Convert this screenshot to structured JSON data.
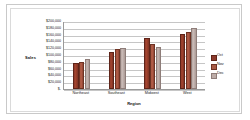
{
  "chart_data": {
    "type": "bar",
    "title": "",
    "xlabel": "Region",
    "ylabel": "Sales",
    "categories": [
      "Northeast",
      "Southeast",
      "Midwest",
      "West"
    ],
    "series": [
      {
        "name": "Oct",
        "color": "#8d3a2c",
        "values": [
          76000,
          110000,
          150000,
          163000
        ]
      },
      {
        "name": "Nov",
        "color": "#a85a44",
        "values": [
          79000,
          117000,
          132000,
          167000
        ]
      },
      {
        "name": "Dec",
        "color": "#bdaca7",
        "values": [
          89000,
          122000,
          125000,
          180000
        ]
      }
    ],
    "ylim": [
      0,
      200000
    ],
    "ytick_values": [
      0,
      20000,
      40000,
      60000,
      80000,
      100000,
      120000,
      140000,
      160000,
      180000,
      200000
    ],
    "ytick_labels": [
      "$-",
      "$20,000",
      "$40,000",
      "$60,000",
      "$80,000",
      "$100,000",
      "$120,000",
      "$140,000",
      "$160,000",
      "$180,000",
      "$200,000"
    ],
    "grid": true,
    "legend_position": "right"
  }
}
